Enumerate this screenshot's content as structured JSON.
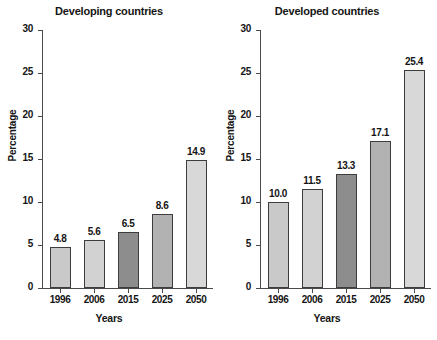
{
  "chart_data": [
    {
      "type": "bar",
      "title": "Developing countries",
      "xlabel": "Years",
      "ylabel": "Percentage",
      "categories": [
        "1996",
        "2006",
        "2015",
        "2025",
        "2050"
      ],
      "values": [
        4.8,
        5.6,
        6.5,
        8.6,
        14.9
      ],
      "value_labels": [
        "4.8",
        "5.6",
        "6.5",
        "8.6",
        "14.9"
      ],
      "ylim": [
        0,
        30
      ],
      "yticks": [
        0,
        5,
        10,
        15,
        20,
        25,
        30
      ],
      "ytick_labels": [
        "0",
        "5",
        "10",
        "15",
        "20",
        "25",
        "30"
      ],
      "grid": false,
      "legend": "none",
      "bar_colors": [
        "#c9c9c9",
        "#d2d2d2",
        "#8d8d8d",
        "#b2b2b2",
        "#d8d8d8"
      ]
    },
    {
      "type": "bar",
      "title": "Developed countries",
      "xlabel": "Years",
      "ylabel": "Percentage",
      "categories": [
        "1996",
        "2006",
        "2015",
        "2025",
        "2050"
      ],
      "values": [
        10.0,
        11.5,
        13.3,
        17.1,
        25.4
      ],
      "value_labels": [
        "10.0",
        "11.5",
        "13.3",
        "17.1",
        "25.4"
      ],
      "ylim": [
        0,
        30
      ],
      "yticks": [
        0,
        5,
        10,
        15,
        20,
        25,
        30
      ],
      "ytick_labels": [
        "0",
        "5",
        "10",
        "15",
        "20",
        "25",
        "30"
      ],
      "grid": false,
      "legend": "none",
      "bar_colors": [
        "#c9c9c9",
        "#d2d2d2",
        "#8d8d8d",
        "#b2b2b2",
        "#d8d8d8"
      ]
    }
  ],
  "panels": [
    {
      "title": "Developing countries",
      "ylabel": "Percentage",
      "xlabel": "Years"
    },
    {
      "title": "Developed countries",
      "ylabel": "Percentage",
      "xlabel": "Years"
    }
  ],
  "colors": {
    "axis": "#4a4a4a",
    "bar_outline": "#3d3d3d",
    "text": "#151515",
    "background": "#ffffff"
  }
}
